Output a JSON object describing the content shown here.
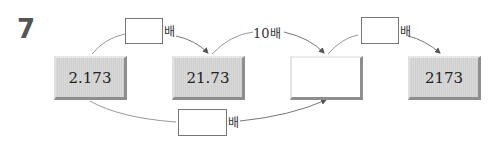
{
  "problem": {
    "number": "7",
    "boxes": [
      {
        "id": "box1",
        "value": "2.173"
      },
      {
        "id": "box2",
        "value": "21.73"
      },
      {
        "id": "box3",
        "value": ""
      },
      {
        "id": "box4",
        "value": "2173"
      }
    ],
    "arrows": [
      {
        "from": "box1",
        "to": "box2",
        "multiplier_blank": true,
        "suffix": "배"
      },
      {
        "from": "box2",
        "to": "box3",
        "multiplier": "10",
        "suffix": "배"
      },
      {
        "from": "box3",
        "to": "box4",
        "multiplier_blank": true,
        "suffix": "배"
      },
      {
        "from": "box1",
        "to": "box3",
        "multiplier_blank": true,
        "suffix": "배"
      }
    ],
    "label_10": "10",
    "unit": "배"
  }
}
